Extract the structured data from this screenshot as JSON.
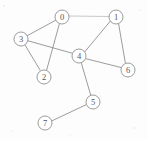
{
  "figure": {
    "type": "node-link-diagram",
    "background_color": "#fdfdfd",
    "stroke_color": "#8a8a8a",
    "node_fill_color": "#ffffff",
    "label_color": "#555555",
    "node_radius": 7
  },
  "graph": {
    "node_count": 8,
    "edge_count": 10,
    "directed": false,
    "nodes": [
      {
        "id": "n0",
        "label": "0",
        "x": 62,
        "y": 17
      },
      {
        "id": "n1",
        "label": "1",
        "x": 116,
        "y": 17
      },
      {
        "id": "n2",
        "label": "2",
        "x": 44,
        "y": 77
      },
      {
        "id": "n3",
        "label": "3",
        "x": 21,
        "y": 39
      },
      {
        "id": "n4",
        "label": "4",
        "x": 79,
        "y": 56
      },
      {
        "id": "n5",
        "label": "5",
        "x": 93,
        "y": 102
      },
      {
        "id": "n6",
        "label": "6",
        "x": 128,
        "y": 70
      },
      {
        "id": "n7",
        "label": "7",
        "x": 45,
        "y": 123
      }
    ],
    "edges": [
      {
        "from": "n0",
        "to": "n1",
        "x1": 69,
        "y1": 16,
        "x2": 109,
        "y2": 16.5,
        "faint": true
      },
      {
        "from": "n0",
        "to": "n3",
        "x1": 55.8,
        "y1": 20.2,
        "x2": 27.4,
        "y2": 35.6,
        "faint": false
      },
      {
        "from": "n0",
        "to": "n2",
        "x1": 59.4,
        "y1": 23.8,
        "x2": 46.6,
        "y2": 70.2,
        "faint": false
      },
      {
        "from": "n3",
        "to": "n2",
        "x1": 24.9,
        "y1": 44.8,
        "x2": 40.1,
        "y2": 70.2,
        "faint": false
      },
      {
        "from": "n3",
        "to": "n4",
        "x1": 28,
        "y1": 40.8,
        "x2": 72.1,
        "y2": 53.2,
        "faint": false
      },
      {
        "from": "n1",
        "to": "n4",
        "x1": 110.3,
        "y1": 21.1,
        "x2": 84.7,
        "y2": 51.9,
        "faint": false
      },
      {
        "from": "n1",
        "to": "n6",
        "x1": 118.6,
        "y1": 23.8,
        "x2": 125.4,
        "y2": 63.2,
        "faint": false
      },
      {
        "from": "n4",
        "to": "n6",
        "x1": 85.9,
        "y1": 58.7,
        "x2": 121.3,
        "y2": 67.6,
        "faint": false
      },
      {
        "from": "n4",
        "to": "n5",
        "x1": 81.3,
        "y1": 62.9,
        "x2": 90.7,
        "y2": 95.1,
        "faint": false
      },
      {
        "from": "n5",
        "to": "n7",
        "x1": 86.4,
        "y1": 104.6,
        "x2": 51.8,
        "y2": 120.9,
        "faint": false
      }
    ],
    "adjacency_list": {
      "0": [
        "1",
        "2",
        "3"
      ],
      "1": [
        "0",
        "4",
        "6"
      ],
      "2": [
        "0",
        "3"
      ],
      "3": [
        "0",
        "2",
        "4"
      ],
      "4": [
        "1",
        "3",
        "5",
        "6"
      ],
      "5": [
        "4",
        "7"
      ],
      "6": [
        "1",
        "4"
      ],
      "7": [
        "5"
      ]
    }
  },
  "artifacts": {
    "specks": [
      {
        "x": 4,
        "y": 6,
        "r": 0.7
      },
      {
        "x": 140,
        "y": 10,
        "r": 0.6
      },
      {
        "x": 12,
        "y": 131,
        "r": 0.6
      },
      {
        "x": 134,
        "y": 128,
        "r": 0.7
      },
      {
        "x": 101,
        "y": 96,
        "r": 0.5
      },
      {
        "x": 70,
        "y": 135,
        "r": 0.5
      }
    ]
  }
}
